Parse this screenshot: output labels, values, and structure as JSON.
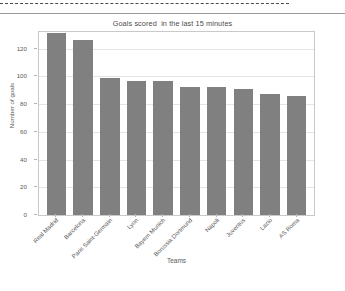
{
  "chart_data": {
    "type": "bar",
    "title": "Goals scored  in the last 15 minutes",
    "xlabel": "Teams",
    "ylabel": "Number of goals",
    "categories": [
      "Real Madrid",
      "Barcelona",
      "Paris Saint-Germain",
      "Lyon",
      "Bayern Munich",
      "Borussia Dortmund",
      "Napoli",
      "Juventus",
      "Lazio",
      "AS Roma"
    ],
    "values": [
      131,
      126,
      99,
      97,
      97,
      92,
      92,
      91,
      87,
      86
    ],
    "ylim": [
      0,
      132
    ],
    "yticks": [
      0,
      20,
      40,
      60,
      80,
      100,
      120
    ],
    "ytick_labels": [
      "0",
      "20",
      "40",
      "60",
      "80",
      "100",
      "120"
    ],
    "grid": true,
    "legend": "none",
    "bar_color": "#808080",
    "grid_color": "#e4e4e4",
    "axis_color": "#c9c9c9",
    "text_color": "#5a5a5a"
  },
  "figure": {
    "background": "#ffffff",
    "selection_marker": "dashed-selection-line"
  }
}
